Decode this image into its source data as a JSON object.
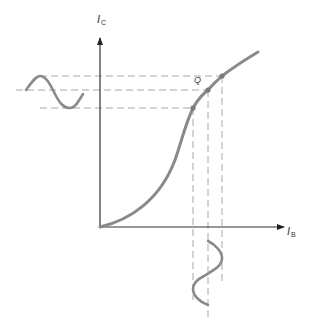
{
  "diagram": {
    "type": "transistor transfer characteristic",
    "y_axis": {
      "label": "I",
      "subscript": "C"
    },
    "x_axis": {
      "label": "I",
      "subscript": "B"
    },
    "operating_point_label": "Q",
    "annotations": {
      "input_waveform": "sine wave on I_B axis (bottom), vertical orientation",
      "output_waveform": "sine wave on I_C axis (left), horizontal orientation",
      "points": [
        "lower",
        "Q",
        "upper"
      ]
    },
    "colors": {
      "curve": "#8a8a8a",
      "axis": "#333333",
      "dashed": "#a0a0a0",
      "point": "#7a7a7a"
    }
  }
}
